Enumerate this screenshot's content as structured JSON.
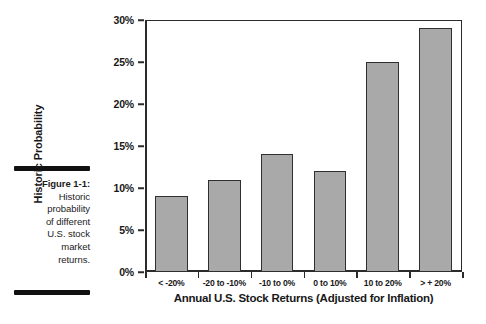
{
  "caption": {
    "figure_label": "Figure 1-1:",
    "lines": [
      "Historic",
      "probability",
      "of different",
      "U.S. stock",
      "market",
      "returns."
    ]
  },
  "chart_data": {
    "type": "bar",
    "title": "",
    "categories": [
      "< -20%",
      "-20 to -10%",
      "-10 to 0%",
      "0 to 10%",
      "10 to 20%",
      "> + 20%"
    ],
    "values": [
      9,
      11,
      14,
      12,
      25,
      29
    ],
    "xlabel": "Annual U.S. Stock Returns (Adjusted for Inflation)",
    "ylabel": "Historic Probability",
    "ylim": [
      0,
      30
    ],
    "yticks": [
      0,
      5,
      10,
      15,
      20,
      25,
      30
    ],
    "ytick_labels": [
      "0%",
      "5%",
      "10%",
      "15%",
      "20%",
      "25%",
      "30%"
    ],
    "grid": false,
    "legend": false,
    "bar_color": "#a9a9a9",
    "bar_edge_color": "#2f2f2f",
    "axis_color": "#2b2b2b"
  }
}
